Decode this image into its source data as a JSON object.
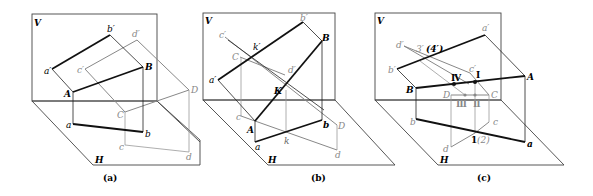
{
  "panels": [
    {
      "id": "a",
      "caption": "(a)",
      "plane_labels": {
        "V": "V",
        "H": "H"
      },
      "labels": {
        "a_prime": "a′",
        "b_prime": "b′",
        "c_prime": "c′",
        "d_prime": "d′",
        "A": "A",
        "B": "B",
        "C": "C",
        "D": "D",
        "a": "a",
        "b": "b",
        "c": "c",
        "d": "d"
      }
    },
    {
      "id": "b",
      "caption": "(b)",
      "plane_labels": {
        "V": "V",
        "H": "H"
      },
      "labels": {
        "a_prime": "a′",
        "b_prime": "b′",
        "c_prime": "c′",
        "d_prime": "d′",
        "k_prime": "k′",
        "A": "A",
        "B": "B",
        "C": "C",
        "D": "D",
        "K": "K",
        "a": "a",
        "b": "b",
        "c": "c",
        "d": "d",
        "k": "k"
      }
    },
    {
      "id": "c",
      "caption": "(c)",
      "plane_labels": {
        "V": "V",
        "H": "H"
      },
      "labels": {
        "a_prime": "a′",
        "b_prime": "b′",
        "c_prime": "c′",
        "d_prime": "d′",
        "p3_prime": "3′",
        "p4_prime": "(4′)",
        "A": "A",
        "B": "B",
        "C": "C",
        "D": "D",
        "I": "Ⅰ",
        "II": "Ⅱ",
        "III": "Ⅲ",
        "IV": "Ⅳ",
        "a": "a",
        "b": "b",
        "c": "c",
        "d": "d",
        "p12": "1",
        "p12_paren": "(2)"
      }
    }
  ],
  "colors": {
    "dark": "#111111",
    "gray": "#888888",
    "plane": "#444444"
  }
}
